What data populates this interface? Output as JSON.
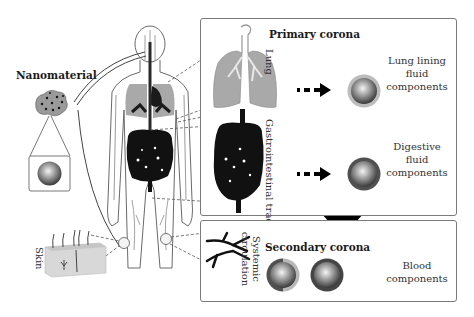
{
  "figure": {
    "nanomaterial_label": "Nanomaterial",
    "primary_corona": {
      "title": "Primary corona",
      "rows": [
        {
          "organ": "Lung",
          "component": [
            "Lung lining",
            "fluid",
            "components"
          ],
          "corona_color": "#b8b8b8"
        },
        {
          "organ": "Gastrointestinal tract",
          "component": [
            "Digestive",
            "fluid",
            "components"
          ],
          "corona_color": "#5a5a5a"
        }
      ]
    },
    "secondary_corona": {
      "title": "Secondary corona",
      "organ": [
        "Systemic",
        "circulation"
      ],
      "component": [
        "Blood",
        "components"
      ]
    },
    "skin_label": "Skin",
    "colors": {
      "box_border": "#7a7a7a",
      "organ_gray": "#a9a9a9",
      "organ_dark": "#111111",
      "arrow": "#000000"
    }
  }
}
